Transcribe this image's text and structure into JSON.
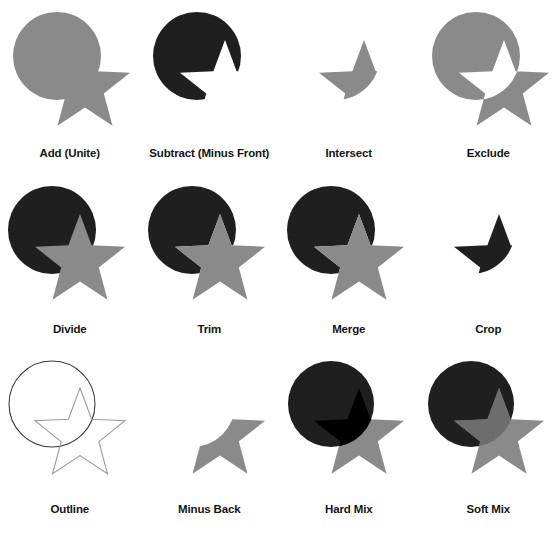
{
  "figure": {
    "background_color": "#ffffff",
    "columns": 4,
    "rows": 3
  },
  "palette": {
    "gray": "#8a8a8a",
    "gray_dark": "#767676",
    "dark": "#1f1f1f",
    "black": "#000000",
    "white": "#ffffff",
    "outline_stroke": "#9b9b9b",
    "circle_outline_stroke": "#3a3a3a",
    "label_color": "#141414"
  },
  "shapes": {
    "circle": {
      "cx": 57,
      "cy": 56,
      "r": 44
    },
    "star": {
      "cx": 85,
      "cy": 86,
      "outer_r": 46,
      "inner_r": 19,
      "points": 5,
      "rotation_deg": -18
    }
  },
  "cells": [
    {
      "id": "add-unite",
      "label": "Add (Unite)",
      "render": "union",
      "description": "Circle and star merged into one gray shape"
    },
    {
      "id": "subtract-minus-front",
      "label": "Subtract (Minus Front)",
      "render": "subtract",
      "description": "Circle with the star shape removed, filled dark"
    },
    {
      "id": "intersect",
      "label": "Intersect",
      "render": "intersect",
      "description": "Only the overlapping region of circle and star, gray"
    },
    {
      "id": "exclude",
      "label": "Exclude",
      "render": "exclude",
      "description": "Union minus the overlap; overlap knocked out to white"
    },
    {
      "id": "divide",
      "label": "Divide",
      "render": "divide",
      "description": "Dark circle behind, gray star on top, split into faces"
    },
    {
      "id": "trim",
      "label": "Trim",
      "render": "trim",
      "description": "Dark circle trimmed under the gray star"
    },
    {
      "id": "merge",
      "label": "Merge",
      "render": "merge",
      "description": "Dark circle trimmed under the gray star, like faces merged"
    },
    {
      "id": "crop",
      "label": "Crop",
      "render": "crop",
      "description": "Only the overlapping region remains, filled dark"
    },
    {
      "id": "outline",
      "label": "Outline",
      "render": "outline",
      "description": "Circle and star reduced to thin outlined strokes"
    },
    {
      "id": "minus-back",
      "label": "Minus Back",
      "render": "minus-back",
      "description": "Star with the circle region removed, gray"
    },
    {
      "id": "hard-mix",
      "label": "Hard Mix",
      "render": "hard-mix",
      "description": "Dark circle over gray star; overlap turns pure black"
    },
    {
      "id": "soft-mix",
      "label": "Soft Mix",
      "render": "soft-mix",
      "description": "Gray star over dark circle; overlap is a darker gray"
    }
  ]
}
